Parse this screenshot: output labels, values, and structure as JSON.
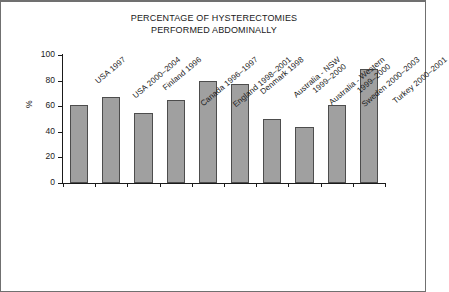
{
  "chart_data": {
    "type": "bar",
    "title": "PERCENTAGE OF HYSTERECTOMIES PERFORMED ABDOMINALLY",
    "title_lines": [
      "PERCENTAGE OF HYSTERECTOMIES",
      "PERFORMED ABDOMINALLY"
    ],
    "xlabel": "",
    "ylabel": "%",
    "ylim": [
      0,
      100
    ],
    "ytick_values": [
      0,
      20,
      40,
      60,
      80,
      100
    ],
    "ytick_labels": [
      "0",
      "20",
      "40",
      "60",
      "80",
      "100"
    ],
    "grid": false,
    "legend": null,
    "bar_color": "#a0a0a0",
    "bar_edge_color": "#4d4d4d",
    "categories": [
      "USA 1997",
      "USA 2000–2004",
      "Finland 1996",
      "Canada 1996–1997",
      "England 1998–2001",
      "Denmark 1998",
      "Australia - NSW 1999–2000",
      "Australia - Western 1999–2000",
      "Sweden 2000–2003",
      "Turkey 2000–2001"
    ],
    "category_label_lines": [
      [
        "USA 1997"
      ],
      [
        "USA 2000–2004"
      ],
      [
        "Finland 1996"
      ],
      [
        "Canada 1996–1997"
      ],
      [
        "England 1998–2001"
      ],
      [
        "Denmark 1998"
      ],
      [
        "Australia - NSW",
        "1999–2000"
      ],
      [
        "Australia - Western",
        "1999–2000"
      ],
      [
        "Sweden 2000–2003"
      ],
      [
        "Turkey 2000–2001"
      ]
    ],
    "values": [
      61,
      67,
      55,
      65,
      80,
      77,
      50,
      44,
      61,
      89
    ]
  }
}
